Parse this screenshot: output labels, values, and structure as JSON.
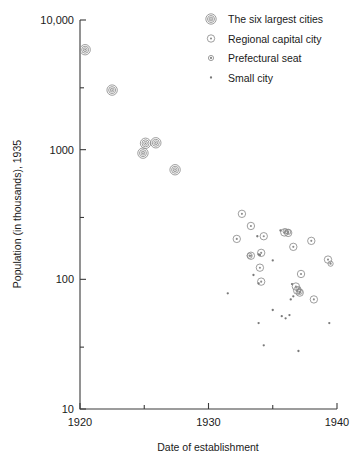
{
  "chart_data": {
    "type": "scatter",
    "title": "",
    "xlabel": "Date of establishment",
    "ylabel": "Population (in thousands), 1935",
    "xlim": [
      1920,
      1940
    ],
    "ylim": [
      10,
      10000
    ],
    "yscale": "log",
    "grid": false,
    "legend_position": "top-right",
    "xticks_major": [
      "1920",
      "1930",
      "1940"
    ],
    "xticks_major_values": [
      1920,
      1930,
      1940
    ],
    "xticks_minor_values": [
      1925,
      1935
    ],
    "yticks_major": [
      "10",
      "100",
      "1000",
      "10,000"
    ],
    "yticks_major_values": [
      10,
      100,
      1000,
      10000
    ],
    "yticks_minor_values": [
      30,
      300,
      3000
    ],
    "series": [
      {
        "name": "The six largest cities",
        "marker": "double-ring-dot",
        "values": [
          {
            "x": 1920.4,
            "y": 5900
          },
          {
            "x": 1922.5,
            "y": 2880
          },
          {
            "x": 1925.1,
            "y": 1120
          },
          {
            "x": 1925.9,
            "y": 1130
          },
          {
            "x": 1924.9,
            "y": 940
          },
          {
            "x": 1927.4,
            "y": 700
          }
        ]
      },
      {
        "name": "Regional capital city",
        "marker": "ring-dot",
        "values": [
          {
            "x": 1932.6,
            "y": 320
          },
          {
            "x": 1933.3,
            "y": 258
          },
          {
            "x": 1932.2,
            "y": 205
          },
          {
            "x": 1934.3,
            "y": 215
          },
          {
            "x": 1935.9,
            "y": 230
          },
          {
            "x": 1936.2,
            "y": 228
          },
          {
            "x": 1936.6,
            "y": 178
          },
          {
            "x": 1938.0,
            "y": 198
          },
          {
            "x": 1934.1,
            "y": 160
          },
          {
            "x": 1933.3,
            "y": 152
          },
          {
            "x": 1934.0,
            "y": 123
          },
          {
            "x": 1939.3,
            "y": 142
          },
          {
            "x": 1937.2,
            "y": 110
          },
          {
            "x": 1934.1,
            "y": 96
          },
          {
            "x": 1936.8,
            "y": 88
          },
          {
            "x": 1936.9,
            "y": 82
          },
          {
            "x": 1938.2,
            "y": 70
          },
          {
            "x": 1937.1,
            "y": 79
          }
        ]
      },
      {
        "name": "Prefectural seat",
        "marker": "small-ring",
        "values": [
          {
            "x": 1933.2,
            "y": 152
          },
          {
            "x": 1936.0,
            "y": 235
          },
          {
            "x": 1936.2,
            "y": 232
          },
          {
            "x": 1939.5,
            "y": 132
          },
          {
            "x": 1937.0,
            "y": 84
          },
          {
            "x": 1937.1,
            "y": 80
          }
        ]
      },
      {
        "name": "Small city",
        "marker": "dot",
        "values": [
          {
            "x": 1933.8,
            "y": 215
          },
          {
            "x": 1935.6,
            "y": 238
          },
          {
            "x": 1933.9,
            "y": 156
          },
          {
            "x": 1934.0,
            "y": 154
          },
          {
            "x": 1935.0,
            "y": 140
          },
          {
            "x": 1933.5,
            "y": 108
          },
          {
            "x": 1933.9,
            "y": 93
          },
          {
            "x": 1931.5,
            "y": 78
          },
          {
            "x": 1936.5,
            "y": 92
          },
          {
            "x": 1936.6,
            "y": 74
          },
          {
            "x": 1936.4,
            "y": 70
          },
          {
            "x": 1935.0,
            "y": 58
          },
          {
            "x": 1935.7,
            "y": 52
          },
          {
            "x": 1936.0,
            "y": 50
          },
          {
            "x": 1936.3,
            "y": 53
          },
          {
            "x": 1933.9,
            "y": 46
          },
          {
            "x": 1939.4,
            "y": 46
          },
          {
            "x": 1934.3,
            "y": 31
          },
          {
            "x": 1937.0,
            "y": 28
          }
        ]
      }
    ]
  },
  "legend": {
    "entries": [
      {
        "label": "The six largest cities",
        "marker": "double-ring-dot"
      },
      {
        "label": "Regional capital city",
        "marker": "ring-dot"
      },
      {
        "label": "Prefectural seat",
        "marker": "small-ring"
      },
      {
        "label": "Small city",
        "marker": "dot"
      }
    ]
  },
  "colors": {
    "axis": "#3a3a3a",
    "marker": "#8d8d8d",
    "dot": "#7a7a7a",
    "text": "#1a1a1a",
    "background": "#ffffff"
  }
}
